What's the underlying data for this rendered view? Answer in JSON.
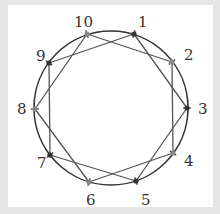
{
  "diagram": {
    "type": "ten-point circle with two interlaced pentagrams",
    "circle": {
      "cx": 111,
      "cy": 108,
      "r": 77,
      "stroke": "#333333"
    },
    "colors": {
      "odd": "#333333",
      "even": "#888888",
      "background": "#e6e6e6",
      "panel": "#ffffff"
    },
    "points": [
      {
        "label": "1",
        "x": 134,
        "y": 34,
        "lx": 138,
        "ly": 27,
        "group": "odd"
      },
      {
        "label": "2",
        "x": 172,
        "y": 62,
        "lx": 184,
        "ly": 60,
        "group": "even"
      },
      {
        "label": "3",
        "x": 187,
        "y": 108,
        "lx": 198,
        "ly": 114,
        "group": "odd"
      },
      {
        "label": "4",
        "x": 173,
        "y": 153,
        "lx": 184,
        "ly": 166,
        "group": "even"
      },
      {
        "label": "5",
        "x": 136,
        "y": 181,
        "lx": 141,
        "ly": 205,
        "group": "odd"
      },
      {
        "label": "6",
        "x": 89,
        "y": 182,
        "lx": 86,
        "ly": 205,
        "group": "even"
      },
      {
        "label": "7",
        "x": 50,
        "y": 155,
        "lx": 37,
        "ly": 168,
        "group": "odd"
      },
      {
        "label": "8",
        "x": 35,
        "y": 109,
        "lx": 17,
        "ly": 114,
        "group": "even"
      },
      {
        "label": "9",
        "x": 49,
        "y": 63,
        "lx": 36,
        "ly": 61,
        "group": "odd"
      },
      {
        "label": "10",
        "x": 87,
        "y": 34,
        "lx": 74,
        "ly": 27,
        "group": "even"
      }
    ],
    "edges": [
      [
        "1",
        "3"
      ],
      [
        "3",
        "5"
      ],
      [
        "5",
        "7"
      ],
      [
        "7",
        "9"
      ],
      [
        "9",
        "1"
      ],
      [
        "2",
        "4"
      ],
      [
        "4",
        "6"
      ],
      [
        "6",
        "8"
      ],
      [
        "8",
        "10"
      ],
      [
        "10",
        "2"
      ]
    ]
  }
}
